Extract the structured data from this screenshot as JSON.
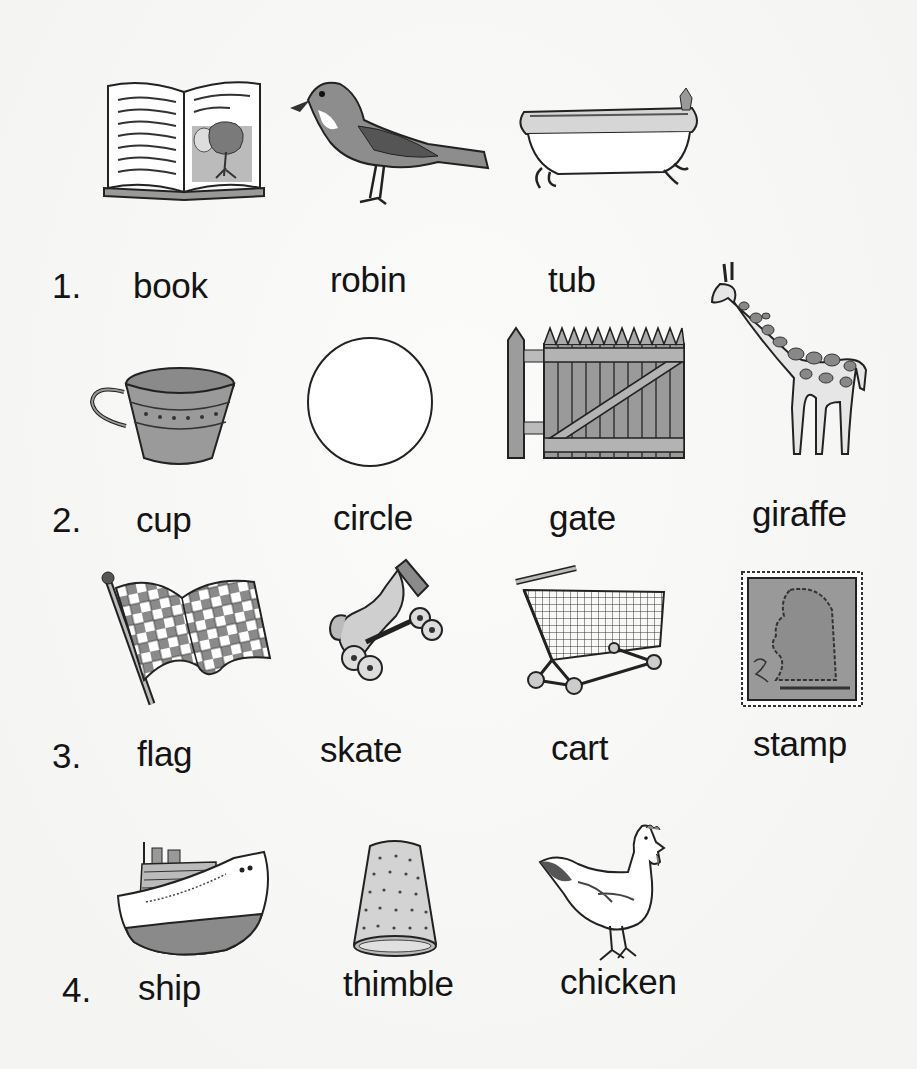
{
  "worksheet": {
    "rows": [
      {
        "number": "1.",
        "items": [
          {
            "word": "book",
            "picture": "open-book-icon"
          },
          {
            "word": "robin",
            "picture": "robin-bird-icon"
          },
          {
            "word": "tub",
            "picture": "bathtub-icon"
          }
        ]
      },
      {
        "number": "2.",
        "items": [
          {
            "word": "cup",
            "picture": "teacup-icon"
          },
          {
            "word": "circle",
            "picture": "circle-shape-icon"
          },
          {
            "word": "gate",
            "picture": "wooden-gate-icon"
          },
          {
            "word": "giraffe",
            "picture": "giraffe-icon"
          }
        ]
      },
      {
        "number": "3.",
        "items": [
          {
            "word": "flag",
            "picture": "checkered-flag-icon"
          },
          {
            "word": "skate",
            "picture": "roller-skate-icon"
          },
          {
            "word": "cart",
            "picture": "shopping-cart-icon"
          },
          {
            "word": "stamp",
            "picture": "postage-stamp-icon"
          }
        ]
      },
      {
        "number": "4.",
        "items": [
          {
            "word": "ship",
            "picture": "ship-icon"
          },
          {
            "word": "thimble",
            "picture": "thimble-icon"
          },
          {
            "word": "chicken",
            "picture": "chicken-icon"
          }
        ]
      }
    ]
  },
  "colors": {
    "ink": "#141414",
    "gray_fill": "#8c8c8c",
    "light_fill": "#c8c8c8",
    "paper": "#f7f7f6"
  }
}
